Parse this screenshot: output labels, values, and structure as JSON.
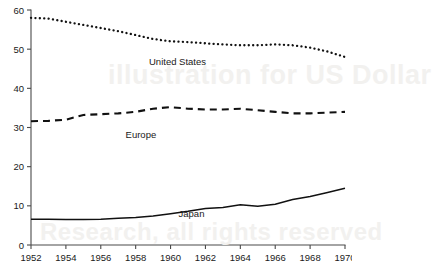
{
  "chart_data": {
    "type": "line",
    "title": "",
    "subtitle": "",
    "xlabel": "",
    "ylabel": "",
    "xlim": [
      1952,
      1970
    ],
    "ylim": [
      0,
      60
    ],
    "ytick_values": [
      0,
      10,
      20,
      30,
      40,
      50,
      60
    ],
    "ytick_labels": [
      "0",
      "10",
      "20",
      "30",
      "40",
      "50",
      "60"
    ],
    "xtick_values": [
      1952,
      1954,
      1956,
      1958,
      1960,
      1962,
      1964,
      1966,
      1968,
      1970
    ],
    "xtick_labels": [
      "1952",
      "1954",
      "1956",
      "1958",
      "1960",
      "1962",
      "1964",
      "1966",
      "1968",
      "1970"
    ],
    "grid": false,
    "legend_position": "inline-labels",
    "x": [
      1952,
      1953,
      1954,
      1955,
      1956,
      1957,
      1958,
      1959,
      1960,
      1961,
      1962,
      1963,
      1964,
      1965,
      1966,
      1967,
      1968,
      1969,
      1970
    ],
    "series": [
      {
        "name": "United States",
        "style": "dotted",
        "color": "#111111",
        "label_x": 1960.4,
        "label_y": 46.0,
        "values": [
          58.0,
          57.8,
          57.0,
          56.2,
          55.4,
          54.6,
          53.6,
          52.6,
          52.0,
          51.8,
          51.5,
          51.2,
          51.0,
          51.0,
          51.2,
          51.0,
          50.4,
          49.4,
          48.0
        ]
      },
      {
        "name": "Europe",
        "style": "dashed",
        "color": "#111111",
        "label_x": 1958.3,
        "label_y": 27.2,
        "values": [
          31.6,
          31.7,
          32.0,
          33.2,
          33.4,
          33.6,
          34.0,
          34.8,
          35.2,
          34.8,
          34.6,
          34.6,
          34.8,
          34.4,
          34.0,
          33.6,
          33.6,
          33.8,
          34.0
        ]
      },
      {
        "name": "Japan",
        "style": "solid",
        "color": "#111111",
        "label_x": 1961.2,
        "label_y": 7.2,
        "values": [
          6.6,
          6.6,
          6.5,
          6.5,
          6.6,
          6.8,
          7.0,
          7.4,
          8.0,
          8.6,
          9.3,
          9.6,
          10.3,
          9.9,
          10.4,
          11.6,
          12.4,
          13.4,
          14.5
        ]
      }
    ]
  },
  "watermark": {
    "line1": "illustration for US Dollar",
    "line2": "Research, all rights reserved"
  },
  "caption": {
    "text": ""
  }
}
